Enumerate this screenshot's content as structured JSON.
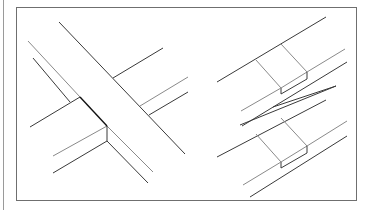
{
  "figure": {
    "panels": [
      {
        "name": "cross-joint",
        "label": ""
      },
      {
        "name": "lap-joints",
        "label": ""
      }
    ],
    "colors": {
      "line": "#3a3a3a",
      "light_line": "#8a8a8a",
      "frame": "#6f6f6f",
      "background": "#ffffff"
    }
  }
}
